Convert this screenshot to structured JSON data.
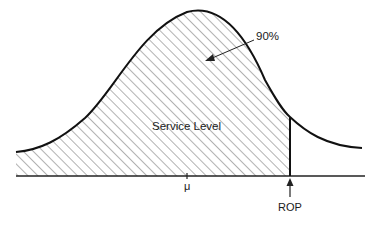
{
  "diagram": {
    "type": "normal-distribution-service-level",
    "labels": {
      "service_level": "Service Level",
      "percentage": "90%",
      "mean": "μ",
      "reorder_point": "ROP"
    },
    "colors": {
      "curve": "#111111",
      "hatch": "#555555",
      "axis": "#222222",
      "background": "#ffffff"
    },
    "annotations": [
      {
        "text": "90%",
        "points_to": "shaded-area"
      },
      {
        "text": "ROP",
        "arrow": "up",
        "marks": "vertical-cutoff-line"
      }
    ]
  }
}
